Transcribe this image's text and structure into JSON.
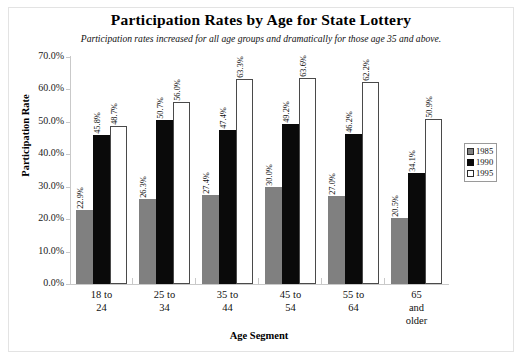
{
  "chart_data": {
    "type": "bar",
    "title": "Participation Rates by Age for State Lottery",
    "subtitle": "Participation rates increased for all age groups and dramatically for those age 35 and above.",
    "xlabel": "Age Segment",
    "ylabel": "Participation Rate",
    "ylim": [
      0,
      70
    ],
    "ytick_labels": [
      "70.0%",
      "60.0%",
      "50.0%",
      "40.0%",
      "30.0%",
      "20.0%",
      "10.0%",
      "0.0%"
    ],
    "ytick_values": [
      70,
      60,
      50,
      40,
      30,
      20,
      10,
      0
    ],
    "grid": false,
    "legend_position": "right",
    "categories": [
      "18 to 24",
      "25 to 34",
      "35 to 44",
      "45 to 54",
      "55 to 64",
      "65 and older"
    ],
    "category_lines": [
      [
        "18 to",
        "24"
      ],
      [
        "25 to",
        "34"
      ],
      [
        "35 to",
        "44"
      ],
      [
        "45 to",
        "54"
      ],
      [
        "55 to",
        "64"
      ],
      [
        "65",
        "and",
        "older"
      ]
    ],
    "series": [
      {
        "name": "1985",
        "color": "#808080",
        "values": [
          22.9,
          26.3,
          27.4,
          30.0,
          27.0,
          20.5
        ],
        "labels": [
          "22.9%",
          "26.3%",
          "27.4%",
          "30.0%",
          "27.0%",
          "20.5%"
        ]
      },
      {
        "name": "1990",
        "color": "#0a0a0a",
        "values": [
          45.8,
          50.7,
          47.4,
          49.2,
          46.2,
          34.1
        ],
        "labels": [
          "45.8%",
          "50.7%",
          "47.4%",
          "49.2%",
          "46.2%",
          "34.1%"
        ]
      },
      {
        "name": "1995",
        "color": "#ffffff",
        "values": [
          48.7,
          56.0,
          63.3,
          63.6,
          62.2,
          50.9
        ],
        "labels": [
          "48.7%",
          "56.0%",
          "63.3%",
          "63.6%",
          "62.2%",
          "50.9%"
        ]
      }
    ]
  }
}
